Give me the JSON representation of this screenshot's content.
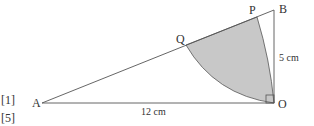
{
  "diagram": {
    "points": {
      "A": {
        "label": "A"
      },
      "B": {
        "label": "B"
      },
      "O": {
        "label": "O"
      },
      "P": {
        "label": "P"
      },
      "Q": {
        "label": "Q"
      }
    },
    "measurements": {
      "OB": "5 cm",
      "AO": "12 cm"
    },
    "marks": [
      "[1]",
      "[5]"
    ],
    "colors": {
      "line": "#555555",
      "shade": "#c8c8c8"
    }
  }
}
